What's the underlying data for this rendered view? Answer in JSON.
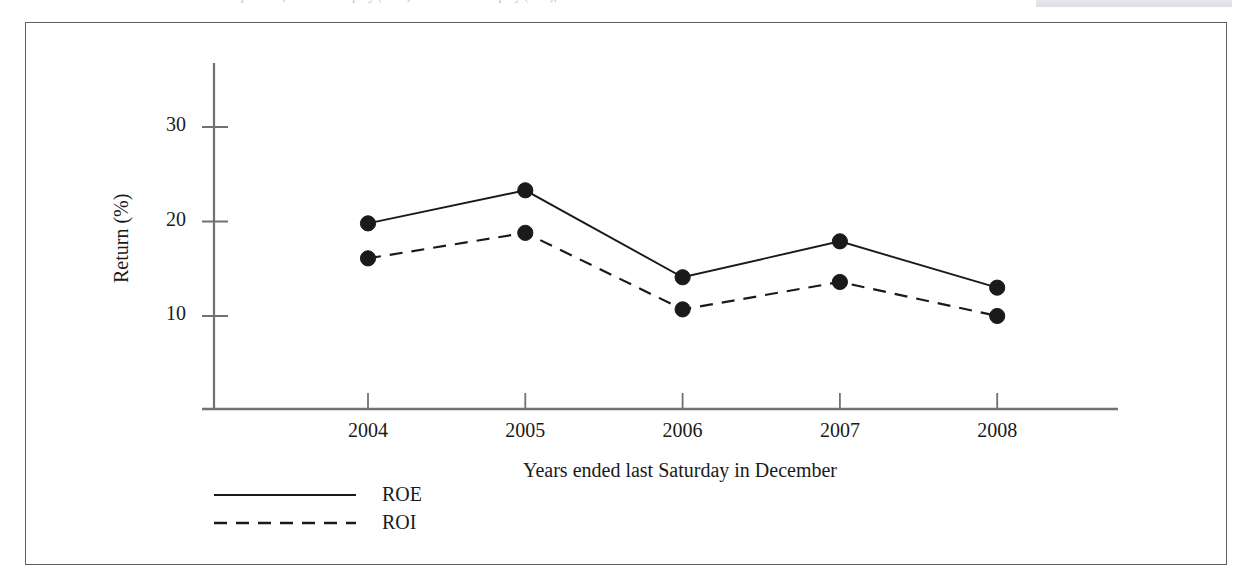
{
  "figure": {
    "background_color": "#ffffff",
    "frame_color": "#5d5d62",
    "ink_color": "#1a1a1a",
    "top_caption_ghost": "Intel Corporation, Return on Equity (ROE) and Return on Equity (ROI), ..."
  },
  "axes": {
    "y_title": "Return (%)",
    "x_title": "Years ended last Saturday in December",
    "y_ticks": [
      "10",
      "20",
      "30"
    ],
    "x_ticks": [
      "2004",
      "2005",
      "2006",
      "2007",
      "2008"
    ]
  },
  "legend": {
    "position": "below-axis-left",
    "entries": [
      {
        "label": "ROE",
        "style": "solid"
      },
      {
        "label": "ROI",
        "style": "dashed"
      }
    ]
  },
  "chart_data": {
    "type": "line",
    "title": "",
    "subtitle": "",
    "xlabel": "Years ended last Saturday in December",
    "ylabel": "Return (%)",
    "categories": [
      "2004",
      "2005",
      "2006",
      "2007",
      "2008"
    ],
    "x": [
      2004,
      2005,
      2006,
      2007,
      2008
    ],
    "ylim": [
      0,
      34
    ],
    "xlim": [
      2003.5,
      2008.5
    ],
    "y_ticks": [
      10,
      20,
      30
    ],
    "grid": false,
    "legend_position": "bottom-left",
    "markers": "filled-circle",
    "series": [
      {
        "name": "ROE",
        "style": "solid",
        "color": "#1a1a1a",
        "values": [
          19.8,
          23.3,
          14.1,
          17.9,
          13.0
        ]
      },
      {
        "name": "ROI",
        "style": "dashed",
        "color": "#1a1a1a",
        "values": [
          16.1,
          18.8,
          10.7,
          13.6,
          10.0
        ]
      }
    ]
  }
}
